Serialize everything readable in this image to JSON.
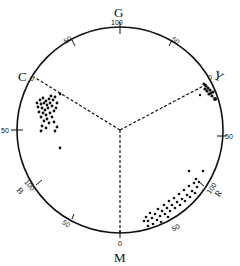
{
  "diagram": {
    "type": "circular color-hue diagram",
    "center": [
      120,
      130
    ],
    "radius": 103,
    "axis_labels": {
      "G": "G",
      "Y": "Y",
      "C": "C",
      "M": "M",
      "B": "B",
      "R": "R"
    },
    "tick_labels": {
      "g100": "100",
      "top_left_50": "50",
      "top_right_50": "50",
      "c0": "0",
      "y0": "0",
      "left_50": "50",
      "right_50": "50",
      "b100": "100",
      "r100": "100",
      "bottom_left_50": "50",
      "bottom_right_50": "50",
      "m0": "0"
    },
    "clusters": [
      {
        "name": "cluster-near-C",
        "region": "upper-left, inside rim between C and 50 tick"
      },
      {
        "name": "cluster-near-Y",
        "region": "upper-right, at Y rim"
      },
      {
        "name": "cluster-near-R",
        "region": "lower-right, along rim between 50 and 100 R"
      }
    ],
    "colors": {
      "stroke": "#111111",
      "background": "#ffffff"
    }
  }
}
